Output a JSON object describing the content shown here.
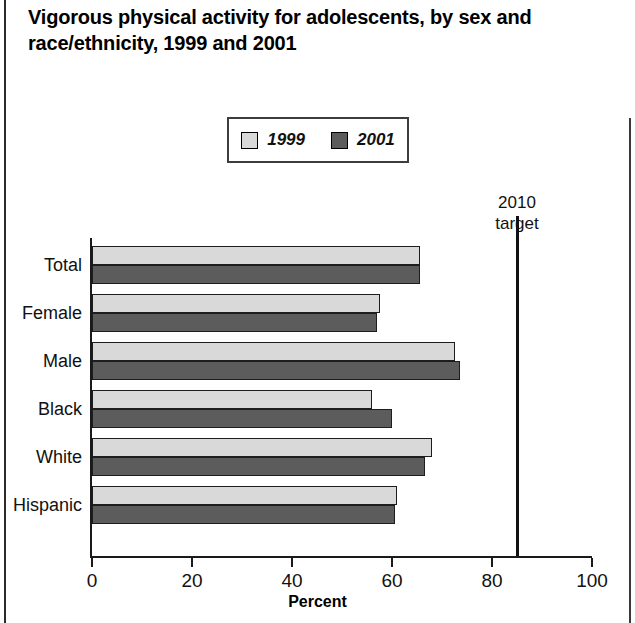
{
  "chart_data": {
    "type": "bar",
    "orientation": "horizontal",
    "title": "Vigorous physical activity for adolescents, by sex and race/ethnicity, 1999 and 2001",
    "xlabel": "Percent",
    "ylabel": "",
    "xlim": [
      0,
      100
    ],
    "xticks": [
      0,
      20,
      40,
      60,
      80,
      100
    ],
    "xtick_labels": [
      "0",
      "20",
      "40",
      "60",
      "80",
      "100"
    ],
    "grid": false,
    "legend_position": "top-center",
    "categories": [
      "Total",
      "Female",
      "Male",
      "Black",
      "White",
      "Hispanic"
    ],
    "series": [
      {
        "name": "1999",
        "color": "#d9d9d9",
        "values": [
          65.5,
          57.5,
          72.5,
          56.0,
          68.0,
          61.0
        ]
      },
      {
        "name": "2001",
        "color": "#5c5c5c",
        "values": [
          65.5,
          57.0,
          73.5,
          60.0,
          66.5,
          60.5
        ]
      }
    ],
    "annotations": [
      {
        "name": "2010-target",
        "label": "2010\ntarget",
        "value": 85
      }
    ]
  },
  "legend": {
    "items": [
      {
        "label": "1999",
        "color": "#d9d9d9"
      },
      {
        "label": "2001",
        "color": "#5c5c5c"
      }
    ]
  }
}
